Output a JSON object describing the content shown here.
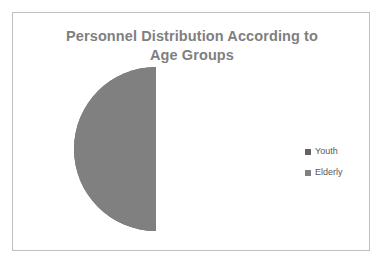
{
  "chart_data": {
    "type": "pie",
    "title": "Personnel Distribution According to Age Groups",
    "title_lines": [
      "Personnel Distribution According to",
      "Age Groups"
    ],
    "categories": [
      "Youth",
      "Elderly"
    ],
    "values": [
      50,
      50
    ],
    "value_unit": "percent",
    "slices": [
      {
        "label": "Youth",
        "value": 50,
        "color": "#636363",
        "start_angle": 180,
        "end_angle": 360
      },
      {
        "label": "Elderly",
        "value": 50,
        "color": "#808080",
        "start_angle": 0,
        "end_angle": 180
      }
    ],
    "legend": {
      "position": "right",
      "entries": [
        {
          "label": "Youth",
          "color": "#636363"
        },
        {
          "label": "Elderly",
          "color": "#808080"
        }
      ]
    },
    "data_labels": false,
    "grid": false,
    "xlabel": "",
    "ylabel": ""
  },
  "frame": {
    "border_color": "#bfbfbf",
    "background": "#ffffff"
  },
  "title": {
    "color": "#7f7f7f",
    "line1": "Personnel Distribution According to",
    "line2": "Age Groups"
  },
  "legend": {
    "items": [
      {
        "label": "Youth",
        "color": "#636363"
      },
      {
        "label": "Elderly",
        "color": "#808080"
      }
    ]
  }
}
